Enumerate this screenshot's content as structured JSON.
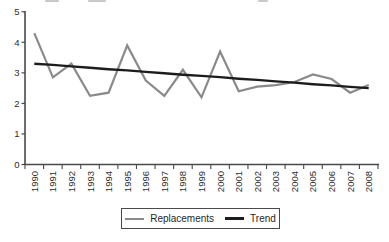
{
  "chart_data": {
    "type": "line",
    "title": "",
    "xlabel": "",
    "ylabel": "",
    "categories": [
      "1990",
      "1991",
      "1992",
      "1993",
      "1994",
      "1995",
      "1996",
      "1997",
      "1998",
      "1999",
      "2000",
      "2001",
      "2002",
      "2003",
      "2004",
      "2005",
      "2006",
      "2007",
      "2008"
    ],
    "series": [
      {
        "name": "Replacements",
        "color": "#8a8a8a",
        "stroke_width": 2.2,
        "values": [
          4.3,
          2.85,
          3.3,
          2.25,
          2.35,
          3.9,
          2.75,
          2.25,
          3.1,
          2.2,
          3.7,
          2.4,
          2.55,
          2.6,
          2.7,
          2.95,
          2.8,
          2.35,
          2.6
        ]
      },
      {
        "name": "Trend",
        "color": "#1c1c1c",
        "stroke_width": 2.4,
        "values": [
          3.3,
          3.26,
          3.21,
          3.17,
          3.12,
          3.08,
          3.03,
          2.99,
          2.94,
          2.9,
          2.86,
          2.81,
          2.77,
          2.72,
          2.68,
          2.63,
          2.59,
          2.54,
          2.5
        ]
      }
    ],
    "ylim": [
      0,
      5
    ],
    "yticks": [
      0,
      1,
      2,
      3,
      4,
      5
    ],
    "x_tick_style": "category-boundaries",
    "x_label_rotation": -90,
    "grid": false,
    "legend_position": "bottom",
    "axis_color": "#4a4a4a",
    "label_color": "#2e2e2e"
  },
  "legend": {
    "items": [
      {
        "label": "Replacements"
      },
      {
        "label": "Trend"
      }
    ]
  }
}
